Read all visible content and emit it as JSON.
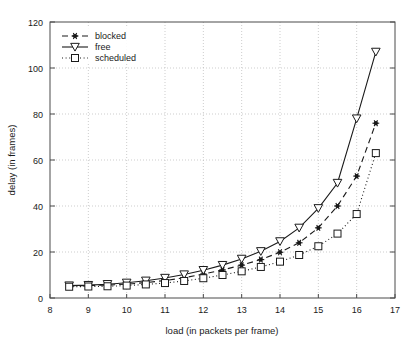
{
  "chart_data": {
    "type": "line",
    "title": "",
    "xlabel": "load (in packets per frame)",
    "ylabel": "delay (in frames)",
    "xlim": [
      8,
      17
    ],
    "ylim": [
      0,
      120
    ],
    "xticks": [
      "8",
      "9",
      "10",
      "11",
      "12",
      "13",
      "14",
      "15",
      "16",
      "17"
    ],
    "yticks": [
      "0",
      "20",
      "40",
      "60",
      "80",
      "100",
      "120"
    ],
    "grid": true,
    "legend_position": "upper-left",
    "x": [
      8.5,
      9.0,
      9.5,
      10.0,
      10.5,
      11.0,
      11.5,
      12.0,
      12.5,
      13.0,
      13.5,
      14.0,
      14.5,
      15.0,
      15.5,
      16.0,
      16.5
    ],
    "series": [
      {
        "name": "blocked",
        "marker": "star-filled",
        "linestyle": "dashed",
        "color": "#1a1a1a",
        "values": [
          5.3,
          5.4,
          5.6,
          6.0,
          6.7,
          7.6,
          8.8,
          10.4,
          12.2,
          14.3,
          16.7,
          19.9,
          24.0,
          30.5,
          40.0,
          53.0,
          76.0
        ]
      },
      {
        "name": "free",
        "marker": "triangle-down-open",
        "linestyle": "solid",
        "color": "#1a1a1a",
        "values": [
          5.4,
          5.6,
          6.0,
          6.6,
          7.5,
          8.7,
          10.2,
          12.1,
          14.3,
          17.0,
          20.3,
          24.6,
          30.5,
          39.0,
          50.0,
          78.0,
          107.0
        ]
      },
      {
        "name": "scheduled",
        "marker": "square-open",
        "linestyle": "dotted",
        "color": "#1a1a1a",
        "values": [
          4.9,
          5.0,
          5.1,
          5.4,
          5.9,
          6.5,
          7.4,
          8.6,
          10.0,
          11.6,
          13.5,
          15.8,
          18.7,
          22.5,
          28.0,
          36.5,
          63.0
        ]
      }
    ]
  },
  "legend": {
    "items": [
      {
        "label": "blocked"
      },
      {
        "label": "free"
      },
      {
        "label": "scheduled"
      }
    ]
  }
}
